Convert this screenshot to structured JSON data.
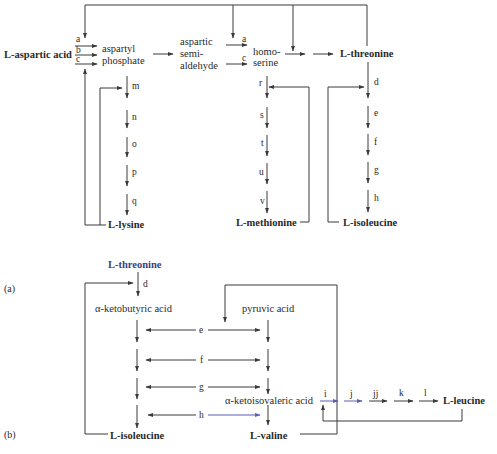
{
  "panels": {
    "a": {
      "label": "(a)",
      "nodes": {
        "aspartic_acid": "L-aspartic acid",
        "aspartyl_phosphate_1": "aspartyl",
        "aspartyl_phosphate_2": "phosphate",
        "aspartic_semialdehyde_1": "aspartic",
        "aspartic_semialdehyde_2": "semi-",
        "aspartic_semialdehyde_3": "aldehyde",
        "homoserine_1": "homo-",
        "homoserine_2": "serine",
        "threonine": "L-threonine",
        "lysine": "L-lysine",
        "methionine": "L-methionine",
        "isoleucine": "L-isoleucine"
      },
      "steps": {
        "a1": "a",
        "b": "b",
        "c1": "c",
        "a2": "a",
        "c2": "c",
        "m": "m",
        "n": "n",
        "o": "o",
        "p": "p",
        "q": "q",
        "r": "r",
        "s": "s",
        "t": "t",
        "u": "u",
        "v": "v",
        "d": "d",
        "e": "e",
        "f": "f",
        "g": "g",
        "h": "h"
      }
    },
    "b": {
      "label": "(b)",
      "nodes": {
        "threonine": "L-threonine",
        "ketobutyric": "α-ketobutyric acid",
        "pyruvic": "pyruvic acid",
        "ketoisovaleric": "α-ketoisovaleric acid",
        "isoleucine": "L-isoleucine",
        "valine": "L-valine",
        "leucine": "L-leucine"
      },
      "steps": {
        "d": "d",
        "e": "e",
        "f": "f",
        "g": "g",
        "h": "h",
        "i": "i",
        "j": "j",
        "jj": "jj",
        "k": "k",
        "l": "l"
      }
    }
  },
  "colors": {
    "line": "#3a3a3a",
    "text": "#2a2a2a",
    "highlight_blue": "#5a5fb0",
    "highlight_text_blue": "#3a3f80"
  }
}
